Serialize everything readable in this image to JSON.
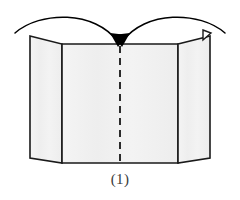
{
  "figure": {
    "caption": "(1)",
    "kind": "folding-instruction-diagram",
    "colors": {
      "panel_fill": "#f2f2f2",
      "panel_fill_center": "#f4f4f4",
      "outline": "#1a1a1a",
      "fold_line": "#2b2b2b",
      "arrow": "#000000",
      "background": "#ffffff",
      "caption_text": "#3a3a3a"
    },
    "panels": [
      {
        "name": "left-panel",
        "label": "left panel",
        "points": "30,158 30,36 62,44 62,163"
      },
      {
        "name": "center-panel",
        "label": "center panel",
        "points": "62,44 178,44 178,163 62,163"
      },
      {
        "name": "right-panel",
        "label": "right panel",
        "points": "178,44 210,36 210,158 178,163"
      }
    ],
    "fold_line": {
      "name": "center-fold-line",
      "label": "center fold line",
      "x1": 120,
      "y1": 46,
      "x2": 120,
      "y2": 161,
      "dash": "7 5"
    },
    "tab": {
      "name": "corner-tab",
      "label": "top right corner tab",
      "points": "203,30 211,33 203,40"
    },
    "arrows": [
      {
        "name": "fold-arrow-left",
        "label": "left fold arrow",
        "path": "M 15,33 C 40,11 95,10 118,42",
        "head": "118,47 110,33 127,35"
      },
      {
        "name": "fold-arrow-right",
        "label": "right fold arrow",
        "path": "M 225,33 C 200,11 145,10 122,42",
        "head": "122,47 113,35 130,33"
      }
    ]
  }
}
